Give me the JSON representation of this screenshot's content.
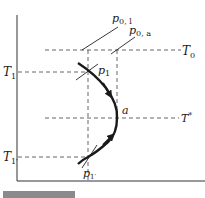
{
  "diagram": {
    "axes": {
      "color": "#333333"
    },
    "levels": {
      "T0": {
        "label": "T",
        "sub": "0"
      },
      "T1": {
        "label": "T",
        "sub": "1"
      },
      "Tstar": {
        "label": "T",
        "sup": "*"
      },
      "T1prime": {
        "label": "T",
        "sub": "1′"
      }
    },
    "points": {
      "p0_l": {
        "label": "p",
        "sub": "0, l"
      },
      "p0_a": {
        "label": "p",
        "sub": "0, a"
      },
      "p1": {
        "label": "p",
        "sub": "1"
      },
      "p1prime": {
        "label": "p",
        "sub": "1′"
      },
      "a": {
        "label": "a"
      }
    },
    "colors": {
      "curve": "#1a1a1a",
      "dashed": "#555555",
      "caption_bar": "#8a8a8a"
    }
  }
}
